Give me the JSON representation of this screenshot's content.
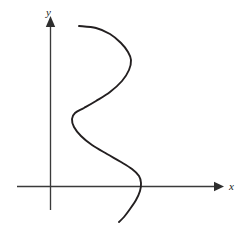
{
  "figure": {
    "title": "",
    "background_color": "#ffffff",
    "width": 247,
    "height": 238,
    "axis_color": "#3a3a3a",
    "curve_color": "#231f20",
    "x_axis_label": "x",
    "y_axis_label": "y"
  },
  "chart_data": {
    "type": "line",
    "title": "",
    "subtitle": "",
    "xlabel": "x",
    "ylabel": "y",
    "grid": false,
    "legend": null,
    "legend_position": "none",
    "annotations": [],
    "xticks": [],
    "yticks": [],
    "xtick_labels": [],
    "ytick_labels": [],
    "xlim": [
      -1.1,
      6.0
    ],
    "ylim": [
      -1.2,
      5.5
    ],
    "origin_px": [
      50,
      186
    ],
    "axes": {
      "x_axis": {
        "from_px": [
          17,
          186
        ],
        "to_px": [
          222,
          186
        ],
        "arrow": "right"
      },
      "y_axis": {
        "from_px": [
          50,
          210
        ],
        "to_px": [
          50,
          18
        ],
        "arrow": "up"
      }
    },
    "series": [
      {
        "name": "curve",
        "orientation": "x-of-y",
        "color": "#231f20",
        "points_px": [
          [
            79,
            26
          ],
          [
            96,
            28
          ],
          [
            110,
            34
          ],
          [
            121,
            43
          ],
          [
            128,
            52
          ],
          [
            131,
            60
          ],
          [
            129,
            70
          ],
          [
            122,
            81
          ],
          [
            110,
            92
          ],
          [
            96,
            101
          ],
          [
            84,
            108
          ],
          [
            75,
            113
          ],
          [
            72,
            119
          ],
          [
            74,
            127
          ],
          [
            81,
            136
          ],
          [
            92,
            145
          ],
          [
            107,
            154
          ],
          [
            121,
            162
          ],
          [
            132,
            169
          ],
          [
            139,
            176
          ],
          [
            141,
            183
          ],
          [
            140,
            191
          ],
          [
            136,
            200
          ],
          [
            130,
            209
          ],
          [
            124,
            217
          ],
          [
            119,
            222
          ]
        ]
      }
    ]
  },
  "labels": {
    "y_label_pos_px": [
      46,
      16
    ],
    "x_label_pos_px": [
      229,
      186
    ]
  }
}
